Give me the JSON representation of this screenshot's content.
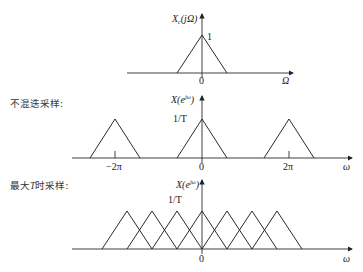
{
  "panels": {
    "continuous": {
      "ylabel": "X",
      "ylabel_sub": "c",
      "ylabel_arg": "(jΩ)",
      "peak_label": "1",
      "origin_label": "0",
      "xlabel": "Ω"
    },
    "no_aliasing": {
      "caption": "不混迭采样:",
      "ylabel": "X(e",
      "ylabel_sup": "jω",
      "ylabel_close": ")",
      "peak_label": "1/T",
      "tick_labels": [
        "−2π",
        "0",
        "2π"
      ],
      "xlabel": "ω"
    },
    "max_T": {
      "caption_prefix": "最大",
      "caption_T": "T",
      "caption_suffix": "时采样:",
      "ylabel": "X(e",
      "ylabel_sup": "jω",
      "ylabel_close": ")",
      "peak_label": "1/T",
      "origin_label": "0",
      "xlabel": "ω"
    }
  },
  "shapes": {
    "continuous_triangles": [
      {
        "cx": 202,
        "half": 25
      }
    ],
    "no_aliasing_triangles": [
      {
        "cx": 115,
        "half": 25
      },
      {
        "cx": 202,
        "half": 25
      },
      {
        "cx": 289,
        "half": 25
      }
    ],
    "max_T_triangles": [
      127,
      152,
      177,
      202,
      227,
      252,
      277
    ]
  }
}
